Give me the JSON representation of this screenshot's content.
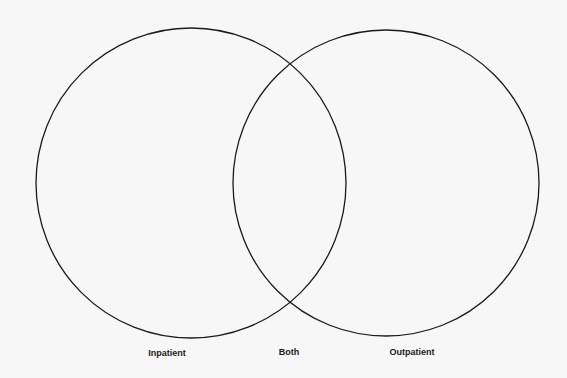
{
  "diagram": {
    "type": "venn",
    "background": "#f7f7f7",
    "stroke_color": "#1a1a1a",
    "sets": [
      {
        "id": "inpatient",
        "label": "Inpatient",
        "cx": 191,
        "cy": 183,
        "r": 155
      },
      {
        "id": "outpatient",
        "label": "Outpatient",
        "cx": 386,
        "cy": 183,
        "r": 153
      }
    ],
    "intersection": {
      "label": "Both"
    }
  },
  "labels": {
    "left": "Inpatient",
    "middle": "Both",
    "right": "Outpatient"
  }
}
